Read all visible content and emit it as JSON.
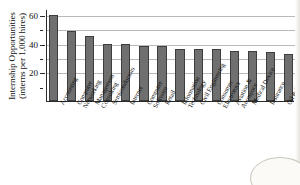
{
  "chart_data": {
    "type": "bar",
    "title": "",
    "xlabel": "",
    "ylabel": "Internship Opportunities (interns per 1,000 hires)",
    "ylabel_line1": "Internship Opportunities",
    "ylabel_line2": "(interns per 1,000 hires)",
    "ylim": [
      0,
      64
    ],
    "grid": true,
    "legend": "none",
    "ytick_labels": [
      "20",
      "40",
      "60"
    ],
    "ytick_values": [
      20,
      40,
      60
    ],
    "yminor_values": [
      10,
      30,
      50
    ],
    "gridline_values": [
      20,
      30,
      40,
      50,
      60
    ],
    "bar_color": "#6f6f6f",
    "bar_edge_color": "#3d3d3d",
    "categories": [
      "Accounting",
      "Computer Networking",
      "Management Consulting",
      "Semiconductors",
      "Internet",
      "Computer Software",
      "Retail",
      "Information Technology",
      "Civil Engineering",
      "Consumer Electronics",
      "Aviation & Aerospace",
      "Medical Device",
      "Insurance",
      "Oil & Energy"
    ],
    "category_lines": [
      [
        "Accounting",
        ""
      ],
      [
        "Computer",
        "Networking"
      ],
      [
        "Management",
        "Consulting"
      ],
      [
        "Semiconductors",
        ""
      ],
      [
        "Internet",
        ""
      ],
      [
        "Computer",
        "Software"
      ],
      [
        "Retail",
        ""
      ],
      [
        "Information",
        "Technology"
      ],
      [
        "Civil Engineering",
        ""
      ],
      [
        "Consumer",
        "Electronics"
      ],
      [
        "Aviation &",
        "Aerospace"
      ],
      [
        "Medical Device",
        ""
      ],
      [
        "Insurance",
        ""
      ],
      [
        "Oil & Energy",
        ""
      ]
    ],
    "values": [
      60,
      49,
      45,
      40,
      40,
      38,
      38,
      36,
      36,
      36,
      35,
      35,
      34,
      33
    ]
  }
}
